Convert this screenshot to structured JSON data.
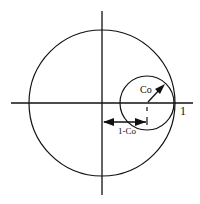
{
  "diagram": {
    "type": "circle-geometry",
    "colors": {
      "stroke": "#111111",
      "background": "#ffffff"
    },
    "axes": {
      "horizontal": true,
      "vertical": true
    },
    "large_circle": {
      "label": "unit circle",
      "radius_units": 1
    },
    "small_circle": {
      "radius_label": "Co"
    },
    "labels": {
      "one": "1",
      "radius": "Co",
      "offset": "1-Co"
    }
  }
}
